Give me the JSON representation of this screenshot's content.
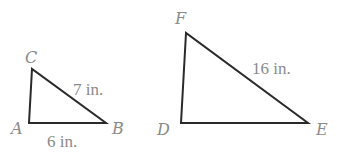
{
  "figure": {
    "type": "similar-triangles",
    "stroke_color": "#2a2a2a",
    "label_color": "#8a8a8a",
    "triangles": [
      {
        "name": "ABC",
        "vertices": {
          "A": {
            "label": "A",
            "x": 29,
            "y": 123
          },
          "B": {
            "label": "B",
            "x": 106,
            "y": 123
          },
          "C": {
            "label": "C",
            "x": 32,
            "y": 69
          }
        },
        "measures": {
          "CB": "7 in.",
          "AB": "6 in."
        }
      },
      {
        "name": "DEF",
        "vertices": {
          "D": {
            "label": "D",
            "x": 181,
            "y": 123
          },
          "E": {
            "label": "E",
            "x": 308,
            "y": 123
          },
          "F": {
            "label": "F",
            "x": 186,
            "y": 33
          }
        },
        "measures": {
          "FE": "16 in."
        }
      }
    ]
  }
}
